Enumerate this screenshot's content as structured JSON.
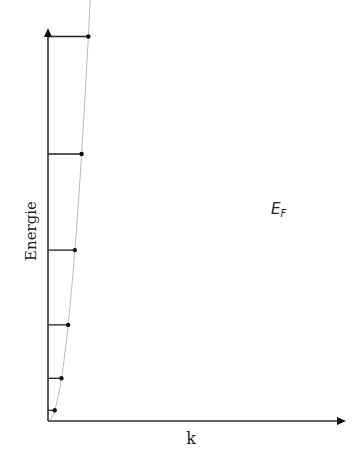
{
  "diagram": {
    "y_axis_label": "Energie",
    "x_axis_label": "k",
    "fermi_label_main": "E",
    "fermi_label_sub": "F",
    "colors": {
      "axis": "#333333",
      "level_line": "#222222",
      "dot": "#111111",
      "curve": "#bbbbbb",
      "text": "#222222"
    }
  },
  "chart_data": {
    "type": "scatter",
    "title": "",
    "xlabel": "k",
    "ylabel": "Energie",
    "dispersion": "E = k^2 (parabola)",
    "filled_levels": 30,
    "total_dots": 39,
    "annotations": [
      "E_F at level 30"
    ],
    "grid": false,
    "geometry": {
      "origin_px": [
        48,
        421
      ],
      "dk_px": 6.72,
      "a_px": 0.2365,
      "y_axis_top_px": 28,
      "x_axis_right_px": 346,
      "curve_end_px": [
        315,
        43
      ]
    }
  }
}
